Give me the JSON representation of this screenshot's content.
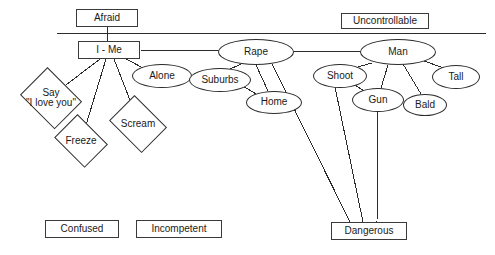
{
  "diagram": {
    "title_nodes": {
      "afraid": "Afraid",
      "uncontrollable": "Uncontrollable"
    },
    "nodes": [
      {
        "id": "afraid",
        "label": "Afraid",
        "shape": "box",
        "x": 76,
        "y": 9,
        "w": 62,
        "h": 18
      },
      {
        "id": "uncontrollable",
        "label": "Uncontrollable",
        "shape": "box",
        "x": 341,
        "y": 13,
        "w": 88,
        "h": 16
      },
      {
        "id": "i-me",
        "label": "I - Me",
        "shape": "box",
        "x": 78,
        "y": 41,
        "w": 62,
        "h": 18
      },
      {
        "id": "rape",
        "label": "Rape",
        "shape": "ellipse",
        "x": 218,
        "y": 39,
        "w": 76,
        "h": 26
      },
      {
        "id": "man",
        "label": "Man",
        "shape": "ellipse",
        "x": 360,
        "y": 39,
        "w": 76,
        "h": 26
      },
      {
        "id": "alone",
        "label": "Alone",
        "shape": "ellipse",
        "x": 132,
        "y": 64,
        "w": 60,
        "h": 24
      },
      {
        "id": "suburbs",
        "label": "Suburbs",
        "shape": "ellipse",
        "x": 189,
        "y": 68,
        "w": 62,
        "h": 24
      },
      {
        "id": "home",
        "label": "Home",
        "shape": "ellipse",
        "x": 246,
        "y": 91,
        "w": 56,
        "h": 23
      },
      {
        "id": "shoot",
        "label": "Shoot",
        "shape": "ellipse",
        "x": 313,
        "y": 64,
        "w": 54,
        "h": 24
      },
      {
        "id": "gun",
        "label": "Gun",
        "shape": "ellipse",
        "x": 352,
        "y": 88,
        "w": 52,
        "h": 24
      },
      {
        "id": "bald",
        "label": "Bald",
        "shape": "ellipse",
        "x": 403,
        "y": 94,
        "w": 44,
        "h": 22
      },
      {
        "id": "tall",
        "label": "Tall",
        "shape": "ellipse",
        "x": 432,
        "y": 65,
        "w": 48,
        "h": 24
      },
      {
        "id": "say-i-love-you",
        "label": "Say\n\"I love you\"",
        "shape": "diamond",
        "x": 18,
        "y": 72,
        "w": 66,
        "h": 52
      },
      {
        "id": "freeze",
        "label": "Freeze",
        "shape": "diamond",
        "x": 52,
        "y": 119,
        "w": 58,
        "h": 44
      },
      {
        "id": "scream",
        "label": "Scream",
        "shape": "diamond",
        "x": 107,
        "y": 100,
        "w": 62,
        "h": 48
      },
      {
        "id": "confused",
        "label": "Confused",
        "shape": "box",
        "x": 45,
        "y": 220,
        "w": 74,
        "h": 18
      },
      {
        "id": "incompetent",
        "label": "Incompetent",
        "shape": "box",
        "x": 136,
        "y": 220,
        "w": 86,
        "h": 18
      },
      {
        "id": "dangerous",
        "label": "Dangerous",
        "shape": "box",
        "x": 331,
        "y": 222,
        "w": 76,
        "h": 18
      }
    ],
    "separator_line": {
      "x1": 57,
      "y1": 33,
      "x2": 486,
      "y2": 33
    },
    "edges": [
      {
        "from": "afraid",
        "to": "i-me",
        "x1": 107,
        "y1": 27,
        "x2": 107,
        "y2": 41
      },
      {
        "from": "i-me",
        "to": "rape",
        "x1": 140,
        "y1": 50,
        "x2": 220,
        "y2": 51
      },
      {
        "from": "rape",
        "to": "man",
        "x1": 292,
        "y1": 51,
        "x2": 362,
        "y2": 51
      },
      {
        "from": "i-me",
        "to": "say-i-love-you",
        "x1": 100,
        "y1": 59,
        "x2": 62,
        "y2": 88
      },
      {
        "from": "i-me",
        "to": "freeze",
        "x1": 106,
        "y1": 59,
        "x2": 86,
        "y2": 125
      },
      {
        "from": "i-me",
        "to": "scream",
        "x1": 114,
        "y1": 59,
        "x2": 133,
        "y2": 108
      },
      {
        "from": "i-me",
        "to": "alone",
        "x1": 126,
        "y1": 59,
        "x2": 147,
        "y2": 70
      },
      {
        "from": "rape",
        "to": "suburbs",
        "x1": 243,
        "y1": 63,
        "x2": 226,
        "y2": 71
      },
      {
        "from": "rape",
        "to": "home",
        "x1": 256,
        "y1": 65,
        "x2": 268,
        "y2": 91
      },
      {
        "from": "suburbs",
        "to": "home",
        "x1": 243,
        "y1": 86,
        "x2": 256,
        "y2": 94
      },
      {
        "from": "rape",
        "to": "dangerous",
        "x1": 272,
        "y1": 64,
        "x2": 350,
        "y2": 222
      },
      {
        "from": "man",
        "to": "shoot",
        "x1": 372,
        "y1": 63,
        "x2": 347,
        "y2": 70
      },
      {
        "from": "man",
        "to": "gun",
        "x1": 388,
        "y1": 65,
        "x2": 381,
        "y2": 88
      },
      {
        "from": "man",
        "to": "bald",
        "x1": 403,
        "y1": 64,
        "x2": 421,
        "y2": 94
      },
      {
        "from": "man",
        "to": "tall",
        "x1": 421,
        "y1": 60,
        "x2": 444,
        "y2": 68
      },
      {
        "from": "shoot",
        "to": "gun",
        "x1": 352,
        "y1": 83,
        "x2": 364,
        "y2": 91
      },
      {
        "from": "shoot",
        "to": "dangerous",
        "x1": 335,
        "y1": 87,
        "x2": 363,
        "y2": 222
      },
      {
        "from": "gun",
        "to": "dangerous",
        "x1": 378,
        "y1": 112,
        "x2": 377,
        "y2": 222
      }
    ],
    "style": {
      "stroke": "#2b2b2b",
      "background": "#ffffff",
      "text_color": "#1a1a1a"
    }
  }
}
